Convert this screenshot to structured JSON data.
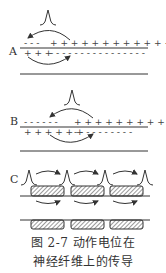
{
  "panels": {
    "a": {
      "label": "A",
      "upper_charges": "– – – + + + + + + + + + + + + +",
      "lower_charges": "+ + + – – – – – – – – – – – – –"
    },
    "b": {
      "label": "B",
      "upper_charges": "– – – – – – + + + + + + + + + +",
      "lower_charges": "+ + + + + + – – – – – – – – – –"
    },
    "c": {
      "label": "C"
    }
  },
  "caption": {
    "line1": "图 2-7   动作电位在",
    "line2": "神经纤维上的传导"
  },
  "colors": {
    "ink": "#333333",
    "hatch": "#555555"
  }
}
